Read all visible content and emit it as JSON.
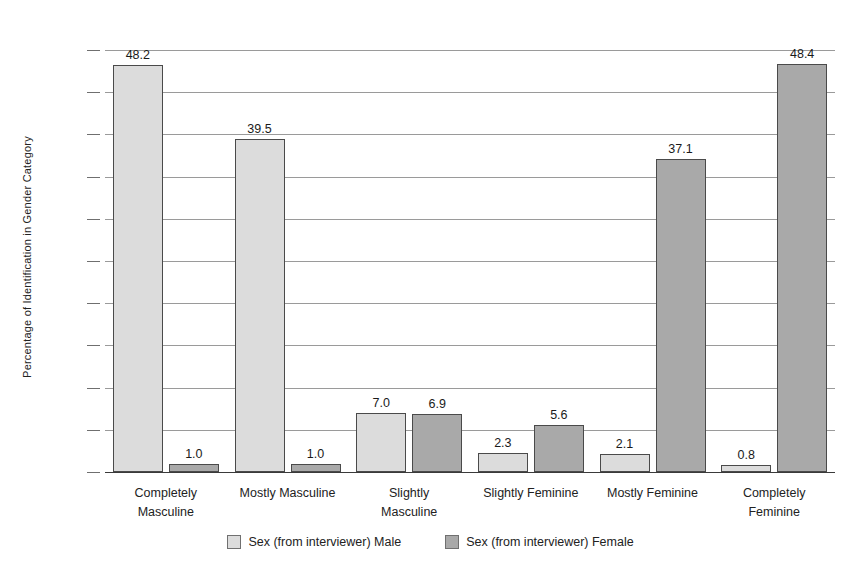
{
  "chart_data": {
    "type": "bar",
    "title": "",
    "xlabel": "",
    "ylabel": "Percentage of Identification in Gender Category",
    "ylim": [
      0,
      50
    ],
    "ytick_labels": [
      "0%",
      "5%",
      "10%",
      "15%",
      "20%",
      "25%",
      "30%",
      "35%",
      "40%",
      "45%",
      "50%"
    ],
    "ytick_values": [
      0,
      5,
      10,
      15,
      20,
      25,
      30,
      35,
      40,
      45,
      50
    ],
    "grid": true,
    "legend_position": "bottom",
    "categories": [
      "Completely Masculine",
      "Mostly Masculine",
      "Slightly Masculine",
      "Slightly Feminine",
      "Mostly Feminine",
      "Completely Feminine"
    ],
    "category_lines": [
      [
        "Completely",
        "Masculine"
      ],
      [
        "Mostly Masculine"
      ],
      [
        "Slightly",
        "Masculine"
      ],
      [
        "Slightly Feminine"
      ],
      [
        "Mostly Feminine"
      ],
      [
        "Completely",
        "Feminine"
      ]
    ],
    "series": [
      {
        "name": "Sex (from interviewer) Male",
        "color": "#dcdcdc",
        "values": [
          48.2,
          39.5,
          7.0,
          2.3,
          2.1,
          0.8
        ],
        "labels": [
          "48.2",
          "39.5",
          "7.0",
          "2.3",
          "2.1",
          "0.8"
        ]
      },
      {
        "name": "Sex (from interviewer) Female",
        "color": "#a9a9a9",
        "values": [
          1.0,
          1.0,
          6.9,
          5.6,
          37.1,
          48.4
        ],
        "labels": [
          "1.0",
          "1.0",
          "6.9",
          "5.6",
          "37.1",
          "48.4"
        ]
      }
    ]
  },
  "legend": {
    "items": [
      {
        "label": "Sex (from interviewer) Male",
        "swatch": "male"
      },
      {
        "label": "Sex (from interviewer) Female",
        "swatch": "female"
      }
    ]
  },
  "colors": {
    "male_bar": "#dcdcdc",
    "female_bar": "#a9a9a9",
    "bar_border": "#4a4a4a",
    "gridline": "#9a9a9a",
    "axis": "#3a3a3a",
    "text": "#222222",
    "background": "#ffffff"
  }
}
